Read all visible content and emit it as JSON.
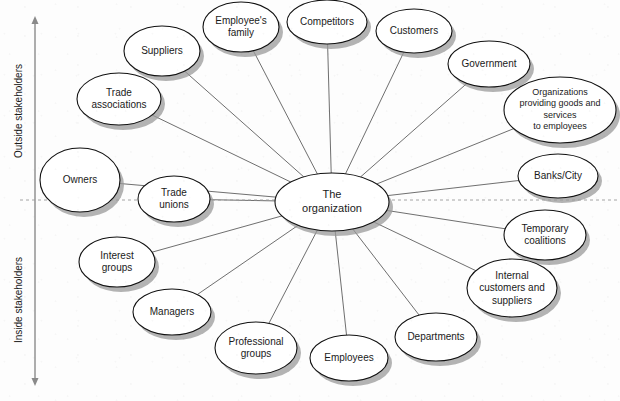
{
  "diagram": {
    "background_color": "#fdfdfd",
    "node_fill": "#ffffff",
    "node_stroke": "#111111",
    "edge_color": "#4a4a4a",
    "shadow_color": "#9a9a9a"
  },
  "axis": {
    "orientation": "vertical",
    "x": 35,
    "top": 22,
    "bottom": 380,
    "upper_label": "Outside stakeholders",
    "lower_label": "Inside stakeholders",
    "divider": {
      "label": "",
      "y": 200,
      "x_start": 20,
      "x_end": 618,
      "style": "dashed"
    }
  },
  "center": {
    "id": "the-organization",
    "label_lines": [
      "The",
      "organization"
    ],
    "cx": 332,
    "cy": 202,
    "rx": 57,
    "ry": 29,
    "font_size": 11
  },
  "nodes": [
    {
      "id": "suppliers",
      "label_lines": [
        "Suppliers"
      ],
      "cx": 162,
      "cy": 51,
      "rx": 38,
      "ry": 25,
      "font_size": 10,
      "group": "outside"
    },
    {
      "id": "employees-family",
      "label_lines": [
        "Employee's",
        "family"
      ],
      "cx": 241,
      "cy": 27,
      "rx": 38,
      "ry": 25,
      "font_size": 10,
      "group": "outside"
    },
    {
      "id": "competitors",
      "label_lines": [
        "Competitors"
      ],
      "cx": 327,
      "cy": 22,
      "rx": 40,
      "ry": 22,
      "font_size": 10,
      "group": "outside"
    },
    {
      "id": "customers",
      "label_lines": [
        "Customers"
      ],
      "cx": 414,
      "cy": 31,
      "rx": 38,
      "ry": 22,
      "font_size": 10,
      "group": "outside"
    },
    {
      "id": "government",
      "label_lines": [
        "Government"
      ],
      "cx": 489,
      "cy": 64,
      "rx": 41,
      "ry": 23,
      "font_size": 10,
      "group": "outside"
    },
    {
      "id": "organizations-providing-goods",
      "label_lines": [
        "Organizations",
        "providing goods and",
        "services",
        "to employees"
      ],
      "cx": 560,
      "cy": 110,
      "rx": 56,
      "ry": 33,
      "font_size": 9,
      "group": "outside"
    },
    {
      "id": "banks-city",
      "label_lines": [
        "Banks/City"
      ],
      "cx": 558,
      "cy": 176,
      "rx": 40,
      "ry": 22,
      "font_size": 10,
      "group": "outside"
    },
    {
      "id": "trade-associations",
      "label_lines": [
        "Trade",
        "associations"
      ],
      "cx": 119,
      "cy": 99,
      "rx": 42,
      "ry": 26,
      "font_size": 10,
      "group": "outside"
    },
    {
      "id": "owners",
      "label_lines": [
        "Owners"
      ],
      "cx": 80,
      "cy": 180,
      "rx": 40,
      "ry": 32,
      "font_size": 10,
      "group": "outside"
    },
    {
      "id": "trade-unions",
      "label_lines": [
        "Trade",
        "unions"
      ],
      "cx": 174,
      "cy": 199,
      "rx": 36,
      "ry": 23,
      "font_size": 10,
      "group": "boundary"
    },
    {
      "id": "temporary-coalitions",
      "label_lines": [
        "Temporary",
        "coalitions"
      ],
      "cx": 545,
      "cy": 235,
      "rx": 41,
      "ry": 25,
      "font_size": 10,
      "group": "inside"
    },
    {
      "id": "internal-customers-and-suppliers",
      "label_lines": [
        "Internal",
        "customers and",
        "suppliers"
      ],
      "cx": 512,
      "cy": 288,
      "rx": 45,
      "ry": 29,
      "font_size": 10,
      "group": "inside"
    },
    {
      "id": "departments",
      "label_lines": [
        "Departments"
      ],
      "cx": 436,
      "cy": 337,
      "rx": 41,
      "ry": 24,
      "font_size": 10,
      "group": "inside"
    },
    {
      "id": "employees",
      "label_lines": [
        "Employees"
      ],
      "cx": 349,
      "cy": 358,
      "rx": 39,
      "ry": 23,
      "font_size": 10,
      "group": "inside"
    },
    {
      "id": "professional-groups",
      "label_lines": [
        "Professional",
        "groups"
      ],
      "cx": 256,
      "cy": 348,
      "rx": 41,
      "ry": 26,
      "font_size": 10,
      "group": "inside"
    },
    {
      "id": "managers",
      "label_lines": [
        "Managers"
      ],
      "cx": 172,
      "cy": 312,
      "rx": 39,
      "ry": 23,
      "font_size": 10,
      "group": "inside"
    },
    {
      "id": "interest-groups",
      "label_lines": [
        "Interest",
        "groups"
      ],
      "cx": 117,
      "cy": 262,
      "rx": 38,
      "ry": 25,
      "font_size": 10,
      "group": "inside"
    }
  ],
  "edges": [
    {
      "from": "the-organization",
      "to": "suppliers"
    },
    {
      "from": "the-organization",
      "to": "employees-family"
    },
    {
      "from": "the-organization",
      "to": "competitors"
    },
    {
      "from": "the-organization",
      "to": "customers"
    },
    {
      "from": "the-organization",
      "to": "government"
    },
    {
      "from": "the-organization",
      "to": "organizations-providing-goods"
    },
    {
      "from": "the-organization",
      "to": "banks-city"
    },
    {
      "from": "the-organization",
      "to": "trade-associations"
    },
    {
      "from": "the-organization",
      "to": "owners"
    },
    {
      "from": "the-organization",
      "to": "trade-unions"
    },
    {
      "from": "the-organization",
      "to": "temporary-coalitions"
    },
    {
      "from": "the-organization",
      "to": "internal-customers-and-suppliers"
    },
    {
      "from": "the-organization",
      "to": "departments"
    },
    {
      "from": "the-organization",
      "to": "employees"
    },
    {
      "from": "the-organization",
      "to": "professional-groups"
    },
    {
      "from": "the-organization",
      "to": "managers"
    },
    {
      "from": "the-organization",
      "to": "interest-groups"
    }
  ]
}
